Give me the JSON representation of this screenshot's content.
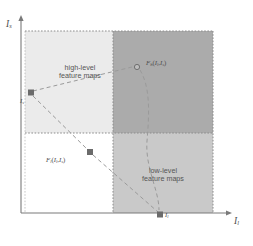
{
  "figure": {
    "type": "schematic-scatter-diagram",
    "background": "#ffffff"
  },
  "axes": {
    "x": {
      "name": "I_l",
      "label_main": "I",
      "label_sub": "l",
      "origin_px": [
        21,
        213
      ],
      "end_px": [
        232,
        213
      ],
      "color": "#7a7a7a"
    },
    "y": {
      "name": "I_s",
      "label_main": "I",
      "label_sub": "s",
      "origin_px": [
        21,
        213
      ],
      "end_px": [
        21,
        16
      ],
      "color": "#7a7a7a"
    }
  },
  "quadrants": [
    {
      "name": "top-left",
      "label_line1": "high-level",
      "label_line2": "feature maps",
      "fill": "#ebebeb",
      "rect": [
        25,
        31,
        88,
        102
      ]
    },
    {
      "name": "top-right",
      "label_line1": "",
      "label_line2": "",
      "fill": "#ababab",
      "rect": [
        113,
        31,
        100,
        102
      ]
    },
    {
      "name": "bottom-left",
      "label_line1": "",
      "label_line2": "",
      "fill": "#ffffff",
      "rect": [
        25,
        133,
        88,
        80
      ]
    },
    {
      "name": "bottom-right",
      "label_line1": "low-level",
      "label_line2": "feature maps",
      "fill": "#c9c9c9",
      "rect": [
        113,
        133,
        100,
        80
      ]
    }
  ],
  "points": [
    {
      "id": "point-is",
      "label_main": "I",
      "label_sub": "s",
      "x": 31,
      "y": 93,
      "marker": "square",
      "color": "#6b6b6b",
      "label_x": 21,
      "label_y": 99
    },
    {
      "id": "point-il",
      "label_main": "I",
      "label_sub": "l",
      "x": 160,
      "y": 215,
      "marker": "square",
      "color": "#6b6b6b",
      "label_x": 165,
      "label_y": 212
    },
    {
      "id": "point-fh",
      "label_main": "F",
      "label_sub": "h",
      "args_main_1": "I",
      "args_sub_1": "l",
      "args_main_2": "I",
      "args_sub_2": "s",
      "x": 137,
      "y": 67,
      "marker": "circle",
      "color": "#7d7d7d",
      "label_x": 146,
      "label_y": 61
    },
    {
      "id": "point-fl",
      "label_main": "F",
      "label_sub": "l",
      "args_main_1": "I",
      "args_sub_1": "l",
      "args_main_2": "I",
      "args_sub_2": "s",
      "x": 90,
      "y": 152,
      "marker": "square",
      "color": "#6b6b6b",
      "label_x": 47,
      "label_y": 158
    }
  ],
  "connectors": [
    {
      "name": "is-to-fh",
      "style": "dashed",
      "color": "#9a9a9a",
      "path": "M 32 92 L 133 67"
    },
    {
      "name": "is-to-il-via-fl",
      "style": "dashed",
      "color": "#9a9a9a",
      "path": "M 32 95 L 90 152 L 159 214"
    },
    {
      "name": "fh-to-il-curve",
      "style": "dashed",
      "color": "#9a9a9a",
      "path": "M 141 69 C 152 86 150 118 148 142 C 146 170 160 190 160 211"
    }
  ],
  "boundaries": {
    "style": "dotted",
    "color": "#8c8c8c",
    "vertical_x": 113,
    "horizontal_y": 133,
    "top_y": 31,
    "right_x": 213,
    "left_x": 25,
    "bottom_y": 213
  },
  "region_text": {
    "high_level_x": 79,
    "high_level_y": 69,
    "low_level_x": 163,
    "low_level_y": 172
  },
  "colors": {
    "axis": "#7a7a7a",
    "dashed_line": "#9a9a9a",
    "marker": "#6b6b6b",
    "text": "#4d4d4d",
    "quadrant_light": "#ebebeb",
    "quadrant_dark": "#ababab",
    "quadrant_medium": "#c9c9c9"
  }
}
